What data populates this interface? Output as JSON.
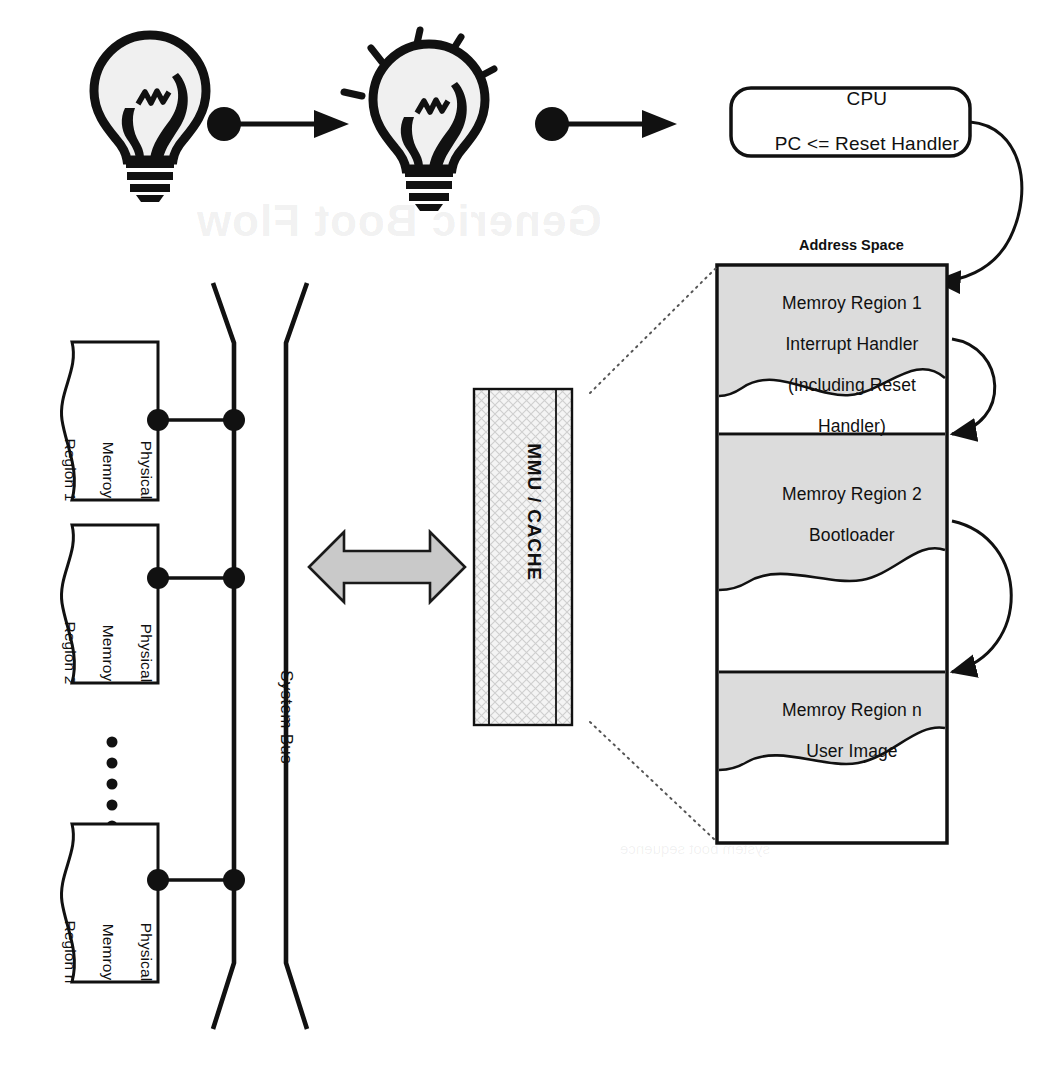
{
  "diagram": {
    "title": "Generic Boot Flow",
    "type": "system-architecture-boot-flow"
  },
  "flow": {
    "steps": [
      {
        "id": "bulb-off",
        "icon": "lightbulb-off-icon",
        "label": ""
      },
      {
        "id": "bulb-on",
        "icon": "lightbulb-lit-icon",
        "label": ""
      },
      {
        "id": "cpu",
        "icon": "",
        "label": "CPU"
      }
    ],
    "connector_icon": "dot-arrow-connector-icon"
  },
  "cpu": {
    "line1": "CPU",
    "line2": "PC <= Reset Handler"
  },
  "address_space": {
    "label": "Address Space",
    "regions": [
      {
        "id": "region-1",
        "lines": [
          "Memroy Region 1",
          "Interrupt Handler",
          "(Including Reset",
          "Handler)"
        ],
        "fill": "#dcdcdc"
      },
      {
        "id": "region-2",
        "lines": [
          "Memroy Region 2",
          "Bootloader"
        ],
        "fill": "#dcdcdc"
      },
      {
        "id": "region-n",
        "lines": [
          "Memroy Region n",
          "User Image"
        ],
        "fill": "#dcdcdc"
      }
    ]
  },
  "mmu": {
    "label": "MMU / CACHE",
    "fill": "#f2f2f2",
    "hatch": "crosshatch"
  },
  "system_bus": {
    "label": "System Bus"
  },
  "physical_memory": {
    "blocks": [
      {
        "id": "pm-1",
        "lines": [
          "Physical",
          "Memroy",
          "Region 1"
        ]
      },
      {
        "id": "pm-2",
        "lines": [
          "Physical",
          "Memroy",
          "Region 2"
        ]
      },
      {
        "id": "pm-n",
        "lines": [
          "Physical",
          "Memroy",
          "Region n"
        ]
      }
    ],
    "ellipsis": "•\n•\n•\n•\n•"
  },
  "bus_arrow": {
    "icon": "double-headed-arrow-icon",
    "fill": "#c9c9c9",
    "stroke": "#1a1a1a"
  },
  "watermark": {
    "text": "Generic Boot Flow",
    "text2": "system boot sequence"
  },
  "colors": {
    "ink": "#111111",
    "region_fill": "#dcdcdc",
    "mmu_fill": "#f2f2f2",
    "arrow_gray": "#c9c9c9",
    "background": "#ffffff"
  }
}
